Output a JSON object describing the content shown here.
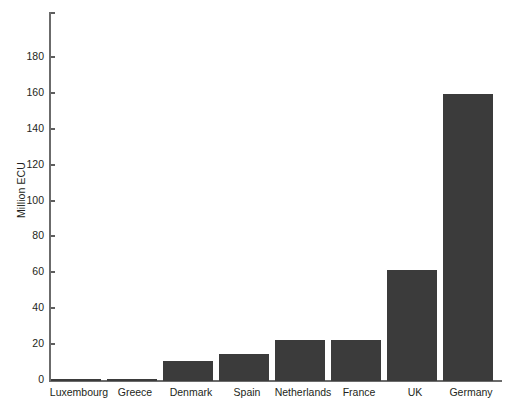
{
  "chart_data": {
    "type": "bar",
    "title": "",
    "xlabel": "",
    "ylabel": "Million ECU",
    "categories": [
      "Luxembourg",
      "Greece",
      "Denmark",
      "Spain",
      "Netherlands",
      "France",
      "UK",
      "Germany"
    ],
    "values": [
      1.3,
      1.3,
      11,
      15,
      23,
      23,
      62,
      160
    ],
    "ylim": [
      0,
      206
    ],
    "yticks": [
      0,
      20,
      40,
      60,
      80,
      100,
      120,
      140,
      160,
      180
    ],
    "ytick_labels": [
      "0",
      "20",
      "40",
      "60",
      "80",
      "100",
      "120",
      "140",
      "160",
      "180"
    ],
    "grid": false,
    "legend": false,
    "bar_color": "#3b3b3b",
    "axis_color": "#6b6b6b",
    "text_color": "#231f20",
    "background": "#ffffff"
  }
}
